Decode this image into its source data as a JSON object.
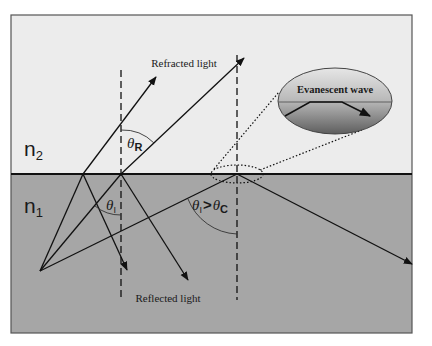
{
  "diagram": {
    "media": {
      "upper": {
        "label": "n",
        "subscript": "2",
        "color": "#ececec"
      },
      "lower": {
        "label": "n",
        "subscript": "1",
        "color": "#a6a6a6"
      }
    },
    "labels": {
      "refracted": "Refracted light",
      "reflected": "Reflected light",
      "evanescent": "Evanescent wave",
      "theta_r": "θ",
      "theta_r_sub": "R",
      "theta_i": "θ",
      "theta_i_sub": "I",
      "condition_theta_i": "θ",
      "condition_theta_i_sub": "I",
      "condition_op": ">",
      "condition_theta_c": "θ",
      "condition_theta_c_sub": "C"
    },
    "colors": {
      "line": "#111111",
      "frame": "#555555",
      "ellipse_top": "#dcdcdc",
      "ellipse_bottom": "#6e6e6e"
    }
  }
}
